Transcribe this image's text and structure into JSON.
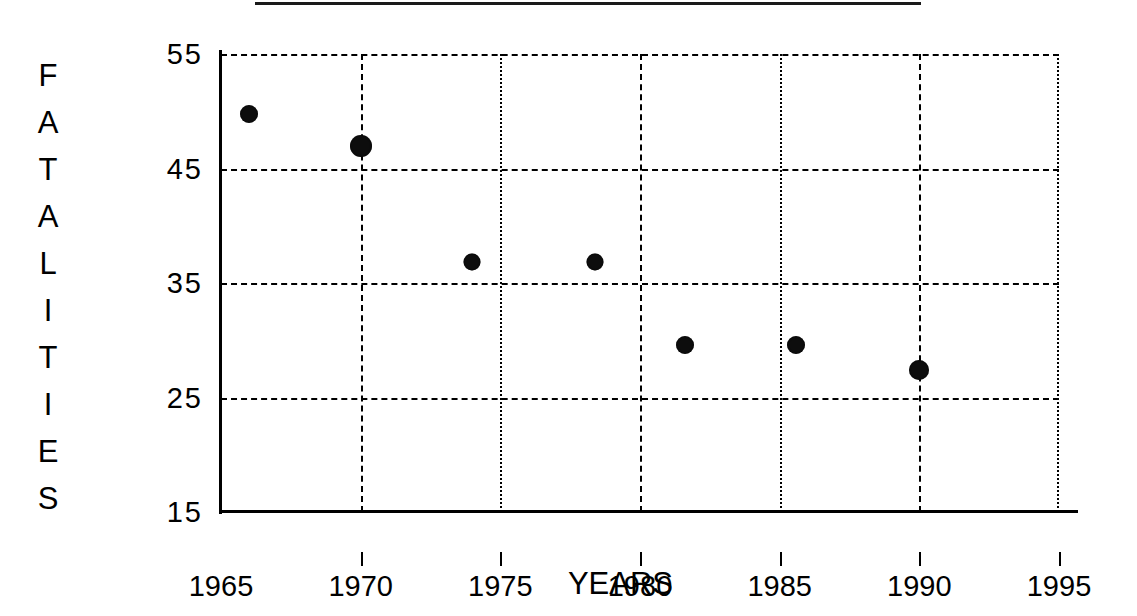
{
  "chart_data": {
    "type": "scatter",
    "title": "",
    "xlabel": "YEARS",
    "ylabel": "FATALITIES",
    "ylabel_letters": [
      "F",
      "A",
      "T",
      "A",
      "L",
      "I",
      "T",
      "I",
      "E",
      "S"
    ],
    "xlim": [
      1965,
      1995
    ],
    "ylim": [
      15,
      55
    ],
    "xticks": [
      1965,
      1970,
      1975,
      1980,
      1985,
      1990,
      1995
    ],
    "xtick_labels": [
      "1965",
      "1970",
      "1975",
      "1980",
      "1985",
      "1990",
      "1995"
    ],
    "yticks": [
      15,
      25,
      35,
      45,
      55
    ],
    "ytick_labels": [
      "15",
      "25",
      "35",
      "45",
      "55"
    ],
    "grid": true,
    "grid_style": "dashed",
    "legend": "none",
    "marker_color": "#0d0d0d",
    "marker_shape": "circle",
    "points": [
      {
        "x": 1966.0,
        "y": 49.8,
        "size": 18
      },
      {
        "x": 1970.0,
        "y": 47.0,
        "size": 22
      },
      {
        "x": 1974.0,
        "y": 36.8,
        "size": 17
      },
      {
        "x": 1978.4,
        "y": 36.8,
        "size": 17
      },
      {
        "x": 1981.6,
        "y": 29.6,
        "size": 18
      },
      {
        "x": 1985.6,
        "y": 29.6,
        "size": 18
      },
      {
        "x": 1990.0,
        "y": 27.4,
        "size": 20
      }
    ]
  },
  "figure": {
    "background_color": "#ffffff",
    "ink_color": "#000000",
    "title_rule_visible": true
  }
}
